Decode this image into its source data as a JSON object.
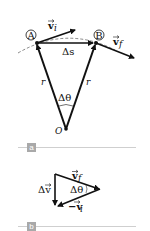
{
  "panel_a": {
    "tag": "a",
    "point_a_label": "A",
    "point_b_label": "B",
    "vi_label": "v",
    "vi_sub": "i",
    "vf_label": "v",
    "vf_sub": "f",
    "ds_label": "Δs",
    "r_left": "r",
    "r_right": "r",
    "dtheta_label": "Δθ",
    "origin_label": "O"
  },
  "panel_b": {
    "tag": "b",
    "vf_label": "v",
    "vf_sub": "f",
    "dv_label": "Δv",
    "dtheta_label": "Δθ",
    "neg_vi_label": "−v",
    "neg_vi_sub": "i"
  },
  "colors": {
    "stroke": "#111111",
    "tag_bg": "#a9a9a9",
    "rule": "#cfcfcf"
  }
}
